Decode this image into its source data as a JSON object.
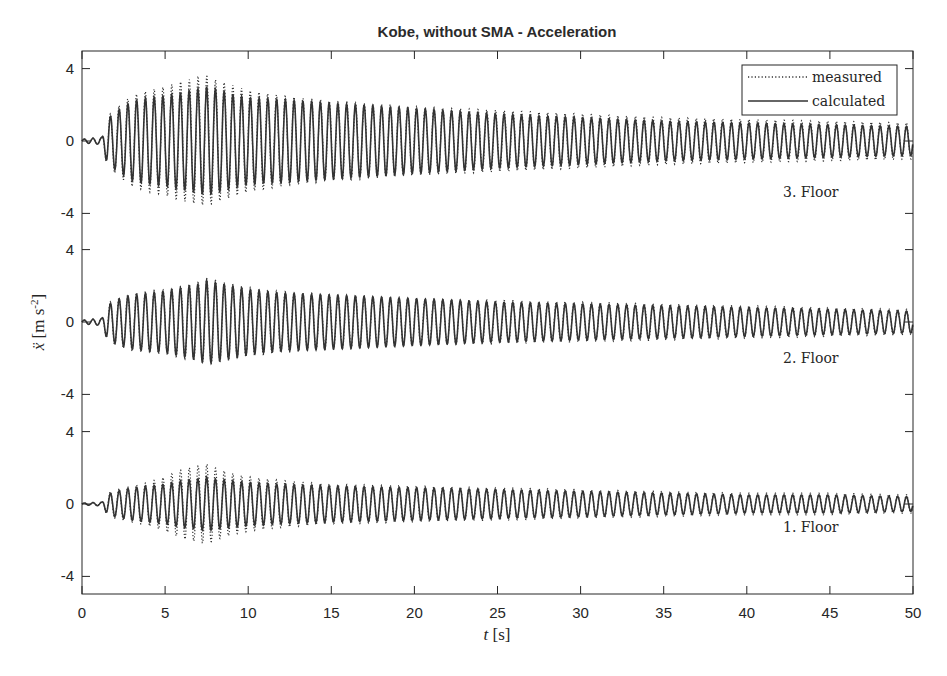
{
  "chart_data": {
    "type": "line",
    "title": "Kobe, without SMA - Acceleration",
    "xlabel": "t [s]",
    "ylabel": "ẍ [m s^-2]",
    "xlim": [
      0,
      50
    ],
    "x_ticks": [
      0,
      5,
      10,
      15,
      20,
      25,
      30,
      35,
      40,
      45,
      50
    ],
    "grid": false,
    "legend": {
      "position": "top-right",
      "entries": [
        {
          "label": "measured",
          "style": "dotted"
        },
        {
          "label": "calculated",
          "style": "solid"
        }
      ]
    },
    "frequency_hz": 1.9,
    "panels": [
      {
        "name": "3. Floor",
        "ylim": [
          -5,
          5
        ],
        "y_ticks": [
          -4,
          0,
          4
        ],
        "envelope_t": [
          0,
          1.2,
          1.5,
          2,
          3,
          4,
          5,
          6,
          7,
          7.5,
          8,
          9,
          10,
          12,
          15,
          20,
          25,
          30,
          35,
          40,
          45,
          50
        ],
        "calculated_amp": [
          0.1,
          0.2,
          1.2,
          1.6,
          2.2,
          2.4,
          2.5,
          2.7,
          2.9,
          3.0,
          2.9,
          2.6,
          2.4,
          2.3,
          2.1,
          1.8,
          1.5,
          1.3,
          1.1,
          1.0,
          0.9,
          0.8
        ],
        "measured_amp": [
          0.1,
          0.2,
          1.3,
          1.8,
          2.5,
          2.8,
          3.0,
          3.3,
          3.5,
          3.6,
          3.4,
          3.1,
          2.8,
          2.5,
          2.2,
          1.9,
          1.7,
          1.5,
          1.3,
          1.2,
          1.1,
          1.0
        ]
      },
      {
        "name": "2. Floor",
        "ylim": [
          -5,
          5
        ],
        "y_ticks": [
          -4,
          0,
          4
        ],
        "envelope_t": [
          0,
          1.2,
          1.5,
          2,
          3,
          4,
          5,
          6,
          7,
          7.5,
          8,
          9,
          10,
          12,
          15,
          20,
          25,
          30,
          35,
          40,
          45,
          50
        ],
        "calculated_amp": [
          0.1,
          0.2,
          0.9,
          1.2,
          1.5,
          1.6,
          1.7,
          1.9,
          2.1,
          2.3,
          2.2,
          2.0,
          1.8,
          1.6,
          1.5,
          1.3,
          1.1,
          1.0,
          0.9,
          0.8,
          0.7,
          0.6
        ],
        "measured_amp": [
          0.1,
          0.2,
          1.0,
          1.3,
          1.6,
          1.7,
          1.8,
          2.0,
          2.2,
          2.4,
          2.3,
          2.1,
          1.9,
          1.7,
          1.5,
          1.3,
          1.2,
          1.1,
          1.0,
          0.9,
          0.8,
          0.7
        ]
      },
      {
        "name": "1. Floor",
        "ylim": [
          -5,
          5
        ],
        "y_ticks": [
          -4,
          0,
          4
        ],
        "envelope_t": [
          0,
          1.2,
          1.5,
          2,
          3,
          4,
          5,
          6,
          7,
          7.5,
          8,
          9,
          10,
          12,
          15,
          20,
          25,
          30,
          35,
          40,
          45,
          50
        ],
        "calculated_amp": [
          0.05,
          0.1,
          0.5,
          0.7,
          0.9,
          1.0,
          1.1,
          1.3,
          1.4,
          1.5,
          1.4,
          1.3,
          1.2,
          1.1,
          1.0,
          0.9,
          0.8,
          0.7,
          0.6,
          0.5,
          0.5,
          0.4
        ],
        "measured_amp": [
          0.05,
          0.1,
          0.6,
          0.8,
          1.0,
          1.2,
          1.5,
          1.9,
          2.1,
          2.2,
          2.0,
          1.7,
          1.5,
          1.3,
          1.1,
          1.0,
          0.9,
          0.8,
          0.7,
          0.6,
          0.6,
          0.5
        ]
      }
    ]
  }
}
